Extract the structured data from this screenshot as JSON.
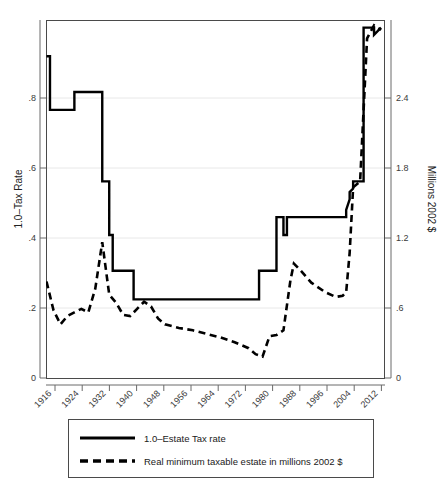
{
  "chart_data": {
    "type": "line",
    "title": "",
    "subtitle": "",
    "xlabel": "",
    "ylabel": "1.0–Tax Rate",
    "y2label": "Millions 2002 $",
    "xlim": [
      1916,
      2013
    ],
    "ylim": [
      0,
      1.0
    ],
    "y2lim": [
      0,
      3.0
    ],
    "grid": true,
    "legend_position": "below-plot",
    "xticks": [
      1916,
      1924,
      1932,
      1940,
      1948,
      1956,
      1964,
      1972,
      1980,
      1988,
      1996,
      2004,
      2012
    ],
    "xticklabels": [
      "1916",
      "1924",
      "1932",
      "1940",
      "1948",
      "1956",
      "1964",
      "1972",
      "1980",
      "1988",
      "1996",
      "2004",
      "2012"
    ],
    "yticks": [
      0,
      0.2,
      0.4,
      0.6,
      0.8
    ],
    "yticklabels": [
      "0",
      ".2",
      ".4",
      ".6",
      ".8"
    ],
    "y2ticks": [
      0,
      0.6,
      1.2,
      1.8,
      2.4
    ],
    "y2ticklabels": [
      "0",
      ".6",
      "1.2",
      "1.8",
      "2.4"
    ],
    "series": [
      {
        "name": "1.0–Estate Tax rate",
        "axis": "left",
        "style": "solid",
        "x": [
          1916,
          1917,
          1917,
          1924,
          1924,
          1926,
          1926,
          1932,
          1932,
          1934,
          1934,
          1935,
          1935,
          1940,
          1940,
          1941,
          1941,
          1942,
          1942,
          1977,
          1977,
          1982,
          1982,
          1984,
          1984,
          1985,
          1985,
          1988,
          1988,
          2002,
          2002,
          2003,
          2003,
          2004,
          2004,
          2005,
          2005,
          2007,
          2007,
          2010,
          2010,
          2012
        ],
        "y": [
          0.9,
          0.9,
          0.75,
          0.75,
          0.8,
          0.8,
          0.8,
          0.8,
          0.55,
          0.55,
          0.4,
          0.4,
          0.3,
          0.3,
          0.3,
          0.3,
          0.22,
          0.22,
          0.22,
          0.22,
          0.3,
          0.3,
          0.45,
          0.45,
          0.4,
          0.4,
          0.45,
          0.45,
          0.45,
          0.45,
          0.47,
          0.5,
          0.52,
          0.53,
          0.55,
          0.55,
          0.55,
          0.55,
          0.98,
          0.98,
          0.96,
          0.98
        ]
      },
      {
        "name": "Real minimum taxable estate in millions 2002 $",
        "axis": "right",
        "style": "dashed",
        "x": [
          1916,
          1918,
          1920,
          1922,
          1924,
          1926,
          1928,
          1930,
          1932,
          1934,
          1936,
          1938,
          1940,
          1942,
          1944,
          1946,
          1948,
          1950,
          1954,
          1958,
          1962,
          1966,
          1970,
          1974,
          1976,
          1978,
          1980,
          1982,
          1984,
          1986,
          1987,
          1989,
          1992,
          1996,
          1999,
          2001,
          2002,
          2003,
          2004,
          2006,
          2008,
          2010,
          2012
        ],
        "y_right": [
          0.81,
          0.57,
          0.45,
          0.52,
          0.55,
          0.58,
          0.55,
          0.75,
          1.14,
          0.7,
          0.63,
          0.53,
          0.52,
          0.58,
          0.64,
          0.6,
          0.5,
          0.45,
          0.42,
          0.4,
          0.37,
          0.34,
          0.3,
          0.25,
          0.2,
          0.18,
          0.35,
          0.36,
          0.4,
          0.82,
          0.96,
          0.9,
          0.8,
          0.72,
          0.68,
          0.69,
          0.72,
          1.05,
          1.6,
          1.65,
          2.85,
          2.96,
          2.92
        ]
      }
    ]
  },
  "legend": {
    "entries": [
      {
        "label": "1.0–Estate Tax rate",
        "style": "solid"
      },
      {
        "label": "Real minimum taxable estate in millions 2002 $",
        "style": "dashed"
      }
    ]
  },
  "colors": {
    "line": "#000000",
    "grid": "#e8e8e8",
    "frame": "#4a4a4a",
    "background": "#ffffff"
  }
}
